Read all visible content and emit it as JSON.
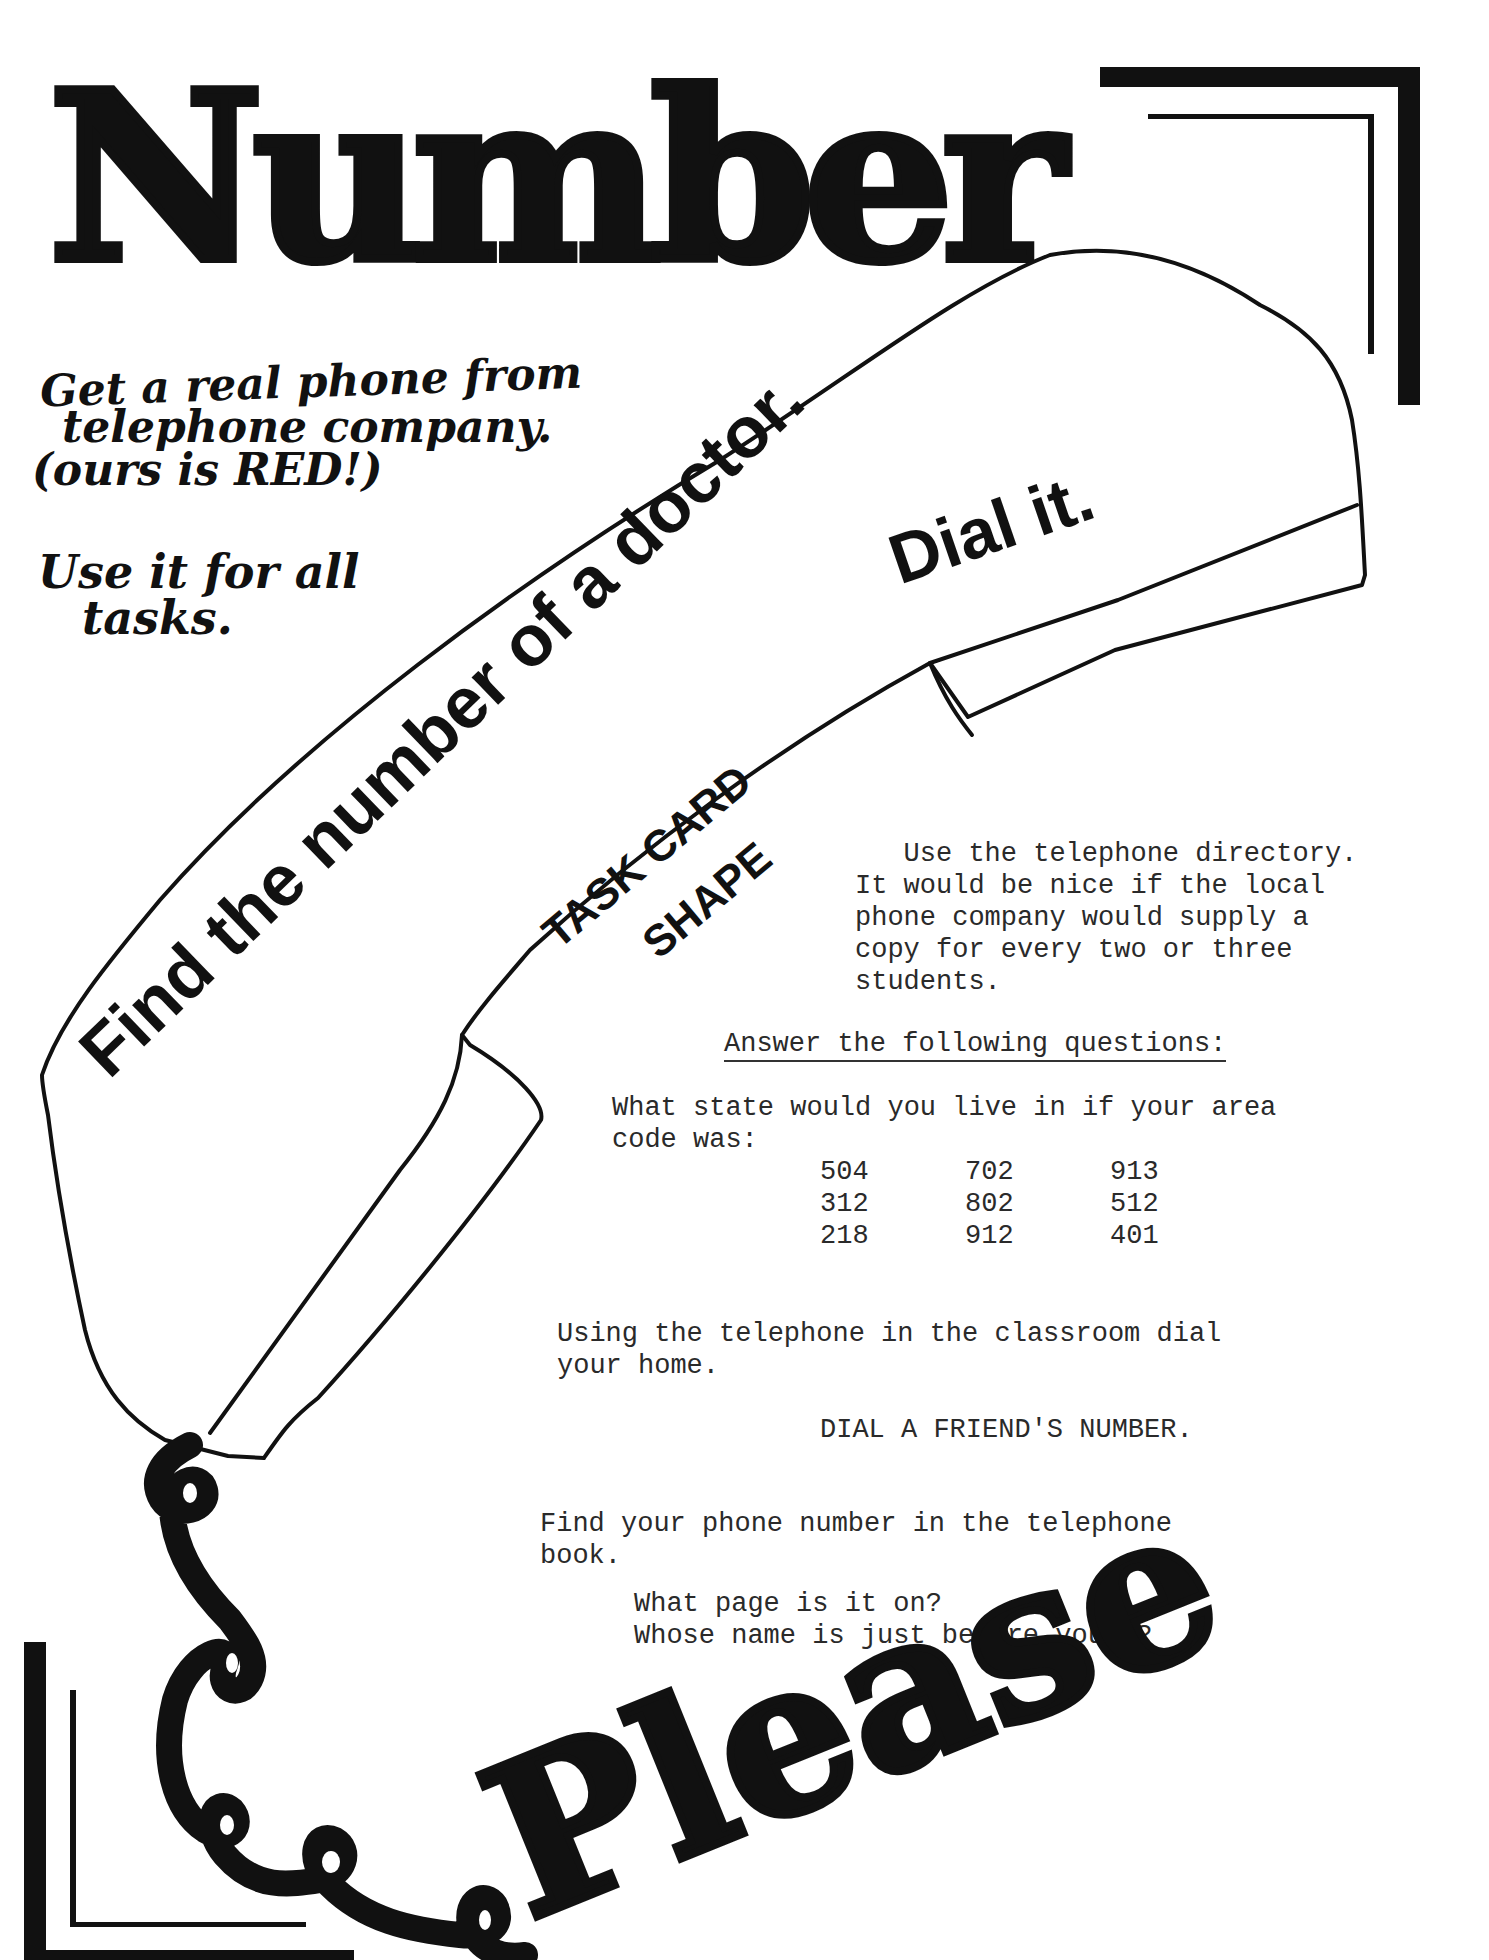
{
  "header": {
    "title": "Number"
  },
  "footer": {
    "title": "Please"
  },
  "notes": {
    "line1": "Get a real phone from",
    "line2": "telephone company.",
    "line3": "(ours is RED!)",
    "line4": "Use it for all",
    "line5": "tasks."
  },
  "phone": {
    "main_task": "Find the number of a doctor.",
    "sub_task": "Dial it.",
    "shape_label_1": "TASK CARD",
    "shape_label_2": "SHAPE"
  },
  "directory": {
    "line1": "   Use the telephone directory.",
    "line2": "It would be nice if the local",
    "line3": "phone company would supply a",
    "line4": "copy for every two or three",
    "line5": "students."
  },
  "questions": {
    "heading": "Answer the following questions:",
    "area_code_prompt_1": "What state would you live in if your area",
    "area_code_prompt_2": "code was:",
    "area_codes": [
      [
        "504",
        "702",
        "913"
      ],
      [
        "312",
        "802",
        "512"
      ],
      [
        "218",
        "912",
        "401"
      ]
    ]
  },
  "activities": {
    "home_1": "Using the telephone in the classroom dial",
    "home_2": "your home.",
    "friend": "DIAL A FRIEND'S NUMBER.",
    "book_1": "Find your phone number in the telephone",
    "book_2": "book.",
    "book_q1": "What page is it on?",
    "book_q2": "Whose name is just before yours?"
  }
}
